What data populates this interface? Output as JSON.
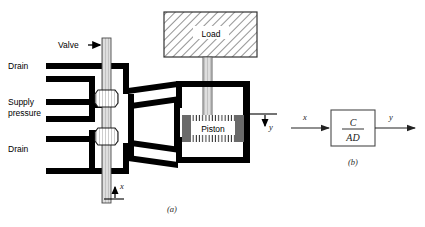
{
  "figure": {
    "panel_a": {
      "caption": "(a)",
      "labels": {
        "valve": "Valve",
        "drain_top": "Drain",
        "supply_line1": "Supply",
        "supply_line2": "pressure",
        "drain_bottom": "Drain",
        "load": "Load",
        "piston": "Piston",
        "input_displacement": "x",
        "output_displacement": "y"
      }
    },
    "panel_b": {
      "caption": "(b)",
      "input_label": "x",
      "output_label": "y",
      "block_numerator": "C",
      "block_denominator": "AD"
    }
  },
  "colors": {
    "line": "#000000",
    "background": "#ffffff",
    "hatch": "#3a3a3a",
    "block_stroke": "#4a4a4a",
    "stem_fill": "#d8d8d8"
  }
}
